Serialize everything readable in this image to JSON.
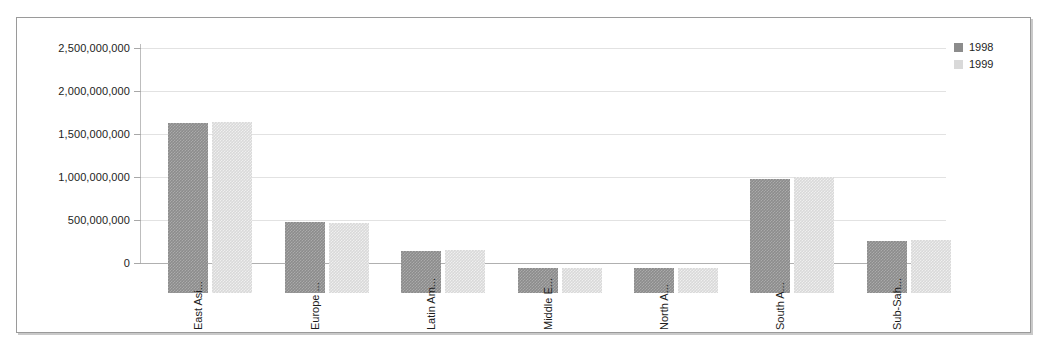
{
  "chart_data": {
    "type": "bar",
    "title": "",
    "xlabel": "",
    "ylabel": "",
    "ylim": [
      0,
      2500000000
    ],
    "grid": true,
    "legend_position": "top-right",
    "categories": [
      "East Asi...",
      "Europe ...",
      "Latin Am...",
      "Middle E...",
      "North A...",
      "South A...",
      "Sub-Sah..."
    ],
    "ytick_labels": [
      "2,500,000,000",
      "2,000,000,000",
      "1,500,000,000",
      "1,000,000,000",
      "500,000,000",
      "0"
    ],
    "ytick_values": [
      2500000000,
      2000000000,
      1500000000,
      1000000000,
      500000000,
      0
    ],
    "series": [
      {
        "name": "1998",
        "color": "#8c8c8c",
        "values": [
          1975000000,
          820000000,
          490000000,
          285000000,
          290000000,
          1325000000,
          610000000
        ]
      },
      {
        "name": "1999",
        "color": "#d9d9d9",
        "values": [
          1990000000,
          815000000,
          495000000,
          288000000,
          288000000,
          1350000000,
          620000000
        ]
      }
    ]
  },
  "legend": {
    "items": [
      {
        "label": "1998",
        "swatch": "legend-swatch-1998"
      },
      {
        "label": "1999",
        "swatch": "legend-swatch-1999"
      }
    ]
  },
  "frame": {
    "border_color": "#9a9a9a",
    "background": "#ffffff",
    "gridline_color": "#e2e2e2",
    "axis_color": "#b0b0b0"
  }
}
